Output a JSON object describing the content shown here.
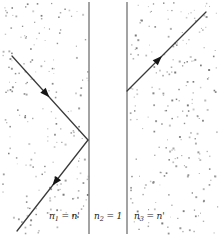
{
  "figure": {
    "width": 219,
    "height": 236,
    "background_color": "#ffffff",
    "boundary_color": "#8c8c8c",
    "ray_color": "#3a3a3a",
    "speckle_color": "#9a9a9a",
    "label_color": "#1a1a1a"
  },
  "regions": [
    {
      "id": "region-1",
      "label_full": "n1 = n'",
      "index_symbol": "n",
      "index_subscript": "1",
      "operator": "=",
      "index_value": "n'",
      "x_left": 0,
      "x_right": 89
    },
    {
      "id": "region-2",
      "label_full": "n2 = 1",
      "index_symbol": "n",
      "index_subscript": "2",
      "operator": "=",
      "index_value": "1",
      "x_left": 89,
      "x_right": 127
    },
    {
      "id": "region-3",
      "label_full": "n3 = n'",
      "index_symbol": "n",
      "index_subscript": "3",
      "operator": "=",
      "index_value": "n'",
      "x_left": 127,
      "x_right": 219
    }
  ],
  "boundaries": [
    {
      "id": "boundary-left",
      "x": 89,
      "y_top": 2,
      "y_bottom": 234
    },
    {
      "id": "boundary-right",
      "x": 127,
      "y_top": 2,
      "y_bottom": 234
    }
  ],
  "rays": [
    {
      "id": "incident-ray",
      "name": "incident-ray",
      "x1": 12,
      "y1": 56,
      "x2": 88,
      "y2": 140,
      "arrow_at": 0.45,
      "direction": "down-right"
    },
    {
      "id": "reflected-ray",
      "name": "reflected-ray",
      "x1": 88,
      "y1": 140,
      "x2": 17,
      "y2": 231,
      "arrow_at": 0.46,
      "direction": "down-left"
    },
    {
      "id": "transmitted-ray",
      "name": "transmitted-ray",
      "x1": 127,
      "y1": 91,
      "x2": 206,
      "y2": 12,
      "arrow_at": 0.4,
      "direction": "up-right"
    }
  ],
  "speckle": {
    "count": 420,
    "seed": 20240517,
    "min_size": 0.8,
    "max_size": 2.0
  }
}
